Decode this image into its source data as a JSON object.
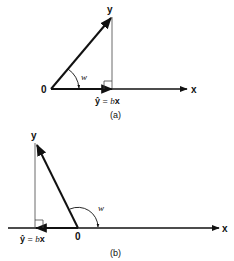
{
  "panel_a": {
    "caption": "(a)",
    "y_label": "y",
    "x_label": "x",
    "origin_label": "0",
    "angle_label": "w",
    "projection_label_hat": "ŷ",
    "projection_label_eq": " = ",
    "projection_label_b": "b",
    "projection_label_x": "x"
  },
  "panel_b": {
    "caption": "(b)",
    "y_label": "y",
    "x_label": "x",
    "origin_label": "0",
    "angle_label": "w",
    "projection_label_hat": "ŷ",
    "projection_label_eq": " = ",
    "projection_label_b": "b",
    "projection_label_x": "x"
  },
  "colors": {
    "ink": "#111111",
    "thin": "#444444"
  }
}
